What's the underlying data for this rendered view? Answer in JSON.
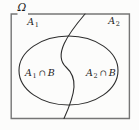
{
  "diagram": {
    "universe_label": "Ω",
    "regions": {
      "a1": {
        "base": "A",
        "sub": "1"
      },
      "a2": {
        "base": "A",
        "sub": "2"
      },
      "a1b": {
        "base": "A",
        "sub": "1",
        "op": "∩",
        "set": "B"
      },
      "a2b": {
        "base": "A",
        "sub": "2",
        "op": "∩",
        "set": "B"
      }
    },
    "colors": {
      "frame": "#757575",
      "curve": "#2e2e2e",
      "text": "#1c1c1c",
      "background": "#fcfcfb"
    }
  }
}
